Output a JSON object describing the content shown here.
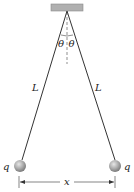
{
  "diagram": {
    "labels": {
      "theta_left": "θ",
      "theta_right": "θ",
      "length_left": "L",
      "length_right": "L",
      "charge_left": "q",
      "charge_right": "q",
      "separation": "x"
    },
    "colors": {
      "support": "#b0b0b0",
      "string": "#333333",
      "sphere": "#a8a8a8",
      "text": "#222222"
    }
  }
}
